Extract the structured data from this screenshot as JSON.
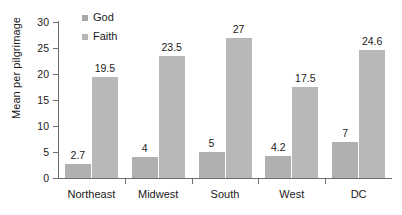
{
  "chart_data": {
    "type": "bar",
    "title": "",
    "subtitle": "",
    "xlabel": "",
    "ylabel": "Mean per pilgrimage",
    "categories": [
      "Northeast",
      "Midwest",
      "South",
      "West",
      "DC"
    ],
    "series": [
      {
        "name": "God",
        "values": [
          2.7,
          4,
          5,
          4.2,
          7
        ],
        "labels": [
          "2.7",
          "4",
          "5",
          "4.2",
          "7"
        ],
        "color": "#b0b0b0"
      },
      {
        "name": "Faith",
        "values": [
          19.5,
          23.5,
          27,
          17.5,
          24.6
        ],
        "labels": [
          "19.5",
          "23.5",
          "27",
          "17.5",
          "24.6"
        ],
        "color": "#b8b8b8"
      }
    ],
    "ylim": [
      0,
      30
    ],
    "yticks": [
      0,
      5,
      10,
      15,
      20,
      25,
      30
    ],
    "ytick_labels": [
      "0",
      "5",
      "10",
      "15",
      "20",
      "25",
      "30"
    ],
    "grid": false,
    "legend_position": "top-left-inside",
    "data_labels_shown": true,
    "axis_color": "#6d6d6d",
    "text_color": "#1a1a1a",
    "background": "#ffffff"
  },
  "legend": {
    "items": [
      {
        "label": "God"
      },
      {
        "label": "Faith"
      }
    ]
  }
}
